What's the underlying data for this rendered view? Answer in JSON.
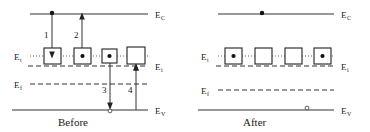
{
  "figure": {
    "colors": {
      "line": "#333333",
      "text": "#1a1a1a",
      "carrier_fill": "#111111",
      "hole_fill": "#ffffff",
      "box_fill": "#ffffff"
    }
  },
  "panels": [
    {
      "id": "before",
      "caption": "Before",
      "levels": [
        {
          "id": "Ec",
          "symbol": "E",
          "subscript": "C",
          "style": "solid",
          "label_side": "right"
        },
        {
          "id": "Et",
          "symbol": "E",
          "subscript": "t",
          "style": "dotted",
          "label_side": "left"
        },
        {
          "id": "Ei",
          "symbol": "E",
          "subscript": "i",
          "style": "dashed",
          "label_side": "right"
        },
        {
          "id": "Ef",
          "symbol": "E",
          "subscript": "f",
          "style": "dashed",
          "label_side": "left"
        },
        {
          "id": "Ev",
          "symbol": "E",
          "subscript": "V",
          "style": "solid",
          "label_side": "right"
        }
      ],
      "trap_boxes": [
        {
          "index": 1,
          "occupied": false
        },
        {
          "index": 2,
          "occupied": true
        },
        {
          "index": 3,
          "occupied": true
        },
        {
          "index": 4,
          "occupied": false
        }
      ],
      "band_carriers": [
        {
          "on": "Ec",
          "type": "electron"
        }
      ],
      "processes": [
        {
          "number": "1",
          "name": "electron-capture",
          "from": "Ec",
          "to": "Et",
          "direction": "down"
        },
        {
          "number": "2",
          "name": "electron-emission",
          "from": "Et",
          "to": "Ec",
          "direction": "up"
        },
        {
          "number": "3",
          "name": "hole-emission",
          "from": "Et",
          "to": "Ev",
          "direction": "down"
        },
        {
          "number": "4",
          "name": "hole-capture",
          "from": "Ev",
          "to": "Et",
          "direction": "up"
        }
      ],
      "valence_carriers": [
        {
          "on": "Ev",
          "type": "hole"
        }
      ]
    },
    {
      "id": "after",
      "caption": "After",
      "levels": [
        {
          "id": "Ec",
          "symbol": "E",
          "subscript": "C",
          "style": "solid",
          "label_side": "right"
        },
        {
          "id": "Et",
          "symbol": "E",
          "subscript": "t",
          "style": "dotted",
          "label_side": "left"
        },
        {
          "id": "Ei",
          "symbol": "E",
          "subscript": "i",
          "style": "dashed",
          "label_side": "right"
        },
        {
          "id": "Ef",
          "symbol": "E",
          "subscript": "f",
          "style": "dashed",
          "label_side": "left"
        },
        {
          "id": "Ev",
          "symbol": "E",
          "subscript": "V",
          "style": "solid",
          "label_side": "right"
        }
      ],
      "trap_boxes": [
        {
          "index": 1,
          "occupied": true
        },
        {
          "index": 2,
          "occupied": false
        },
        {
          "index": 3,
          "occupied": false
        },
        {
          "index": 4,
          "occupied": true
        }
      ],
      "band_carriers": [
        {
          "on": "Ec",
          "type": "electron"
        }
      ],
      "processes": [],
      "valence_carriers": [
        {
          "on": "Ev",
          "type": "hole"
        }
      ]
    }
  ]
}
